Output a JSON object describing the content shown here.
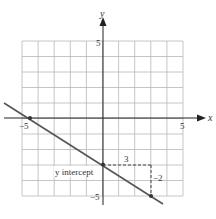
{
  "chart_data": {
    "type": "line",
    "title": "",
    "xlabel": "x",
    "ylabel": "y",
    "xlim": [
      -5,
      5
    ],
    "ylim": [
      -5,
      5
    ],
    "grid": true,
    "tick_labels": {
      "x_min": "-5",
      "x_max": "5",
      "y_max": "5",
      "y_min": "-5"
    },
    "series": [
      {
        "name": "line",
        "equation": "y = -2/3 x - 3",
        "slope": -0.6667,
        "intercept": -3,
        "x": [
          -6,
          4
        ],
        "y": [
          1,
          -5.667
        ]
      }
    ],
    "points": [
      {
        "x": -4.5,
        "y": 0,
        "label": ""
      },
      {
        "x": 0,
        "y": -3,
        "label": "y intercept"
      },
      {
        "x": 3,
        "y": -5,
        "label": ""
      }
    ],
    "annotations": {
      "intercept_label": "y intercept",
      "run_label": "3",
      "rise_label": "−2"
    }
  },
  "axes": {
    "x_label": "x",
    "y_label": "y",
    "x_min_label": "−5",
    "x_max_label": "5",
    "y_max_label": "5",
    "y_min_label": "−5"
  },
  "colors": {
    "grid": "#b8b8b8",
    "axis": "#222222",
    "line": "#555555",
    "text": "#333333"
  }
}
